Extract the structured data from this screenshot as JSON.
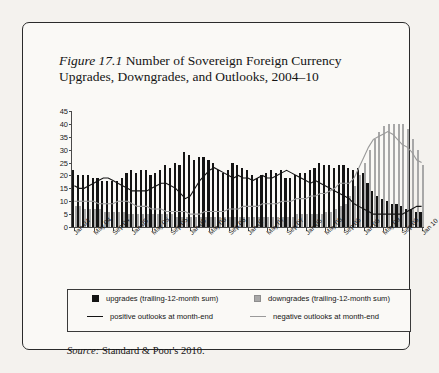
{
  "figure": {
    "label": "Figure 17.1",
    "title": "Number of Sovereign Foreign Currency Upgrades, Downgrades, and Outlooks, 2004–10",
    "title_line1": " Number of Sovereign Foreign Currency",
    "title_line2": "Upgrades, Downgrades, and Outlooks, 2004–10",
    "source_label": "Source:",
    "source_text": " Standard & Poor's 2010."
  },
  "legend": {
    "items": [
      {
        "key": "upgrades",
        "label": "upgrades (trailing-12-month sum)",
        "marker": "square",
        "color": "#141414"
      },
      {
        "key": "downgrades",
        "label": "downgrades (trailing-12-month sum)",
        "marker": "square",
        "color": "#a8a8a8"
      },
      {
        "key": "positive_outlooks",
        "label": "positive outlooks at month-end",
        "marker": "line",
        "color": "#141414"
      },
      {
        "key": "negative_outlooks",
        "label": "negative outlooks at month-end",
        "marker": "line",
        "color": "#9a9a9a"
      }
    ]
  },
  "chart_data": {
    "type": "bar",
    "title": "Number of Sovereign Foreign Currency Upgrades, Downgrades, and Outlooks, 2004–10",
    "xlabel": "",
    "ylabel": "",
    "ylim": [
      0,
      45
    ],
    "yticks": [
      0,
      5,
      10,
      15,
      20,
      25,
      30,
      35,
      40,
      45
    ],
    "grid": false,
    "legend_position": "below-plot",
    "xtick_labels": [
      "Jan 04",
      "May 04",
      "Sep 04",
      "Jan 05",
      "May 05",
      "Sep 05",
      "Jan 06",
      "May 06",
      "Sep 06",
      "Jan 07",
      "May 07",
      "Sep 07",
      "Jan 08",
      "May 08",
      "Sep 08",
      "Jan 09",
      "May 09",
      "Sep 09",
      "Jan 10"
    ],
    "xtick_indices": [
      0,
      4,
      8,
      12,
      16,
      20,
      24,
      28,
      32,
      36,
      40,
      44,
      48,
      52,
      56,
      60,
      64,
      68,
      72
    ],
    "categories": [
      "Jan 04",
      "Feb 04",
      "Mar 04",
      "Apr 04",
      "May 04",
      "Jun 04",
      "Jul 04",
      "Aug 04",
      "Sep 04",
      "Oct 04",
      "Nov 04",
      "Dec 04",
      "Jan 05",
      "Feb 05",
      "Mar 05",
      "Apr 05",
      "May 05",
      "Jun 05",
      "Jul 05",
      "Aug 05",
      "Sep 05",
      "Oct 05",
      "Nov 05",
      "Dec 05",
      "Jan 06",
      "Feb 06",
      "Mar 06",
      "Apr 06",
      "May 06",
      "Jun 06",
      "Jul 06",
      "Aug 06",
      "Sep 06",
      "Oct 06",
      "Nov 06",
      "Dec 06",
      "Jan 07",
      "Feb 07",
      "Mar 07",
      "Apr 07",
      "May 07",
      "Jun 07",
      "Jul 07",
      "Aug 07",
      "Sep 07",
      "Oct 07",
      "Nov 07",
      "Dec 07",
      "Jan 08",
      "Feb 08",
      "Mar 08",
      "Apr 08",
      "May 08",
      "Jun 08",
      "Jul 08",
      "Aug 08",
      "Sep 08",
      "Oct 08",
      "Nov 08",
      "Dec 08",
      "Jan 09",
      "Feb 09",
      "Mar 09",
      "Apr 09",
      "May 09",
      "Jun 09",
      "Jul 09",
      "Aug 09",
      "Sep 09",
      "Oct 09",
      "Nov 09",
      "Dec 09",
      "Jan 10"
    ],
    "series": [
      {
        "name": "upgrades (trailing-12-month sum)",
        "type": "bar",
        "color": "#141414",
        "values": [
          22,
          20,
          20,
          20,
          19,
          19,
          18,
          18,
          18,
          18,
          19,
          21,
          22,
          21,
          22,
          22,
          20,
          21,
          22,
          24,
          23,
          25,
          24,
          29,
          28,
          26,
          27,
          27,
          26,
          25,
          22,
          21,
          22,
          25,
          24,
          23,
          22,
          20,
          19,
          20,
          21,
          22,
          21,
          22,
          19,
          19,
          20,
          21,
          21,
          22,
          23,
          25,
          24,
          24,
          23,
          24,
          24,
          23,
          22,
          23,
          21,
          17,
          14,
          12,
          11,
          10,
          9,
          9,
          8,
          7,
          7,
          6,
          6
        ]
      },
      {
        "name": "downgrades (trailing-12-month sum)",
        "type": "bar",
        "color": "#a8a8a8",
        "values": [
          8,
          8,
          7,
          7,
          7,
          7,
          6,
          6,
          6,
          6,
          6,
          5,
          5,
          5,
          5,
          5,
          5,
          5,
          5,
          5,
          5,
          4,
          4,
          4,
          4,
          4,
          4,
          4,
          4,
          4,
          4,
          4,
          4,
          4,
          4,
          4,
          4,
          4,
          4,
          4,
          4,
          4,
          4,
          4,
          4,
          4,
          5,
          5,
          5,
          5,
          5,
          5,
          6,
          6,
          7,
          8,
          9,
          12,
          16,
          20,
          25,
          30,
          34,
          37,
          39,
          40,
          40,
          40,
          40,
          38,
          34,
          30,
          24
        ]
      },
      {
        "name": "positive outlooks at month-end",
        "type": "line",
        "color": "#141414",
        "values": [
          16,
          15,
          15,
          16,
          17,
          18,
          19,
          19,
          18,
          17,
          16,
          15,
          14,
          14,
          14,
          14,
          15,
          16,
          17,
          17,
          16,
          15,
          13,
          11,
          12,
          15,
          18,
          20,
          22,
          23,
          22,
          21,
          20,
          19,
          20,
          19,
          19,
          18,
          19,
          20,
          19,
          19,
          20,
          21,
          22,
          21,
          20,
          19,
          18,
          17,
          18,
          17,
          16,
          15,
          14,
          13,
          12,
          11,
          9,
          8,
          7,
          6,
          5,
          5,
          5,
          5,
          5,
          5,
          5,
          6,
          7,
          8,
          8
        ]
      },
      {
        "name": "negative outlooks at month-end",
        "type": "line",
        "color": "#9a9a9a",
        "values": [
          10,
          10,
          10,
          10,
          10,
          9,
          9,
          9,
          9,
          10,
          10,
          10,
          9,
          8,
          8,
          8,
          7,
          7,
          7,
          6,
          6,
          6,
          6,
          6,
          5,
          5,
          5,
          6,
          6,
          6,
          6,
          6,
          7,
          7,
          7,
          8,
          8,
          8,
          8,
          9,
          9,
          9,
          9,
          10,
          10,
          10,
          11,
          11,
          11,
          12,
          12,
          13,
          13,
          14,
          15,
          17,
          17,
          17,
          19,
          23,
          27,
          31,
          34,
          35,
          36,
          37,
          36,
          34,
          32,
          31,
          29,
          26,
          25
        ]
      }
    ]
  }
}
